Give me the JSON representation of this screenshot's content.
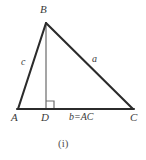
{
  "figure": {
    "caption": "(i)",
    "type": "geometry-diagram",
    "colors": {
      "triangle_stroke": "#2b2b2b",
      "altitude_stroke": "#8f8f8f",
      "right_angle_stroke": "#6e6e6e",
      "label_text": "#3a3a3a",
      "caption_text": "#555555",
      "background": "#ffffff"
    },
    "vertices": [
      {
        "name": "B",
        "label": "B",
        "x": 46,
        "y": 23
      },
      {
        "name": "A",
        "label": "A",
        "x": 18,
        "y": 109
      },
      {
        "name": "C",
        "label": "C",
        "x": 133,
        "y": 109
      },
      {
        "name": "D",
        "label": "D",
        "x": 46,
        "y": 109
      }
    ],
    "sides": [
      {
        "name": "AB",
        "label": "c",
        "from": "A",
        "to": "B"
      },
      {
        "name": "BC",
        "label": "a",
        "from": "B",
        "to": "C"
      },
      {
        "name": "AC",
        "label": "b=AC",
        "from": "A",
        "to": "C"
      }
    ],
    "altitude": {
      "name": "BD",
      "from": "B",
      "to": "D",
      "style": "solid-gray"
    },
    "right_angle": {
      "at": "D",
      "size": 7,
      "marker": "square"
    }
  }
}
